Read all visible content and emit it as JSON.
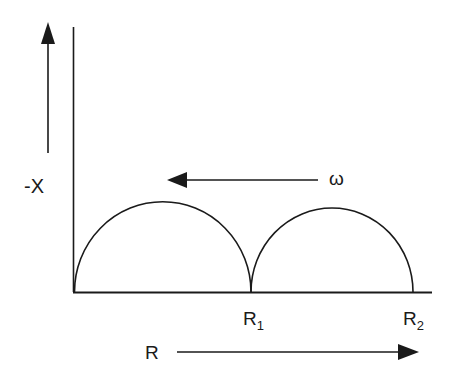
{
  "diagram": {
    "type": "nyquist-impedance-plot",
    "y_axis_label": "-X",
    "x_axis_label": "R",
    "frequency_label": "ω",
    "points": [
      {
        "label": "R",
        "subscript": "1"
      },
      {
        "label": "R",
        "subscript": "2"
      }
    ],
    "arcs": [
      {
        "name": "arc-1",
        "from": "0",
        "to": "R1"
      },
      {
        "name": "arc-2",
        "from": "R1",
        "to": "R2"
      }
    ],
    "colors": {
      "line": "#1a1a1a",
      "background": "#ffffff"
    }
  }
}
